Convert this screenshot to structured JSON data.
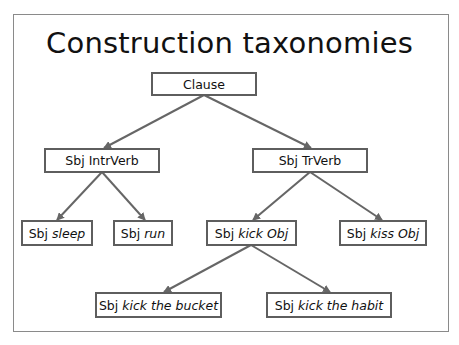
{
  "title": "Construction taxonomies",
  "colors": {
    "edge": "#666666",
    "node_border": "#5e5e5e",
    "text": "#111111",
    "frame": "#8a8a8a"
  },
  "nodes": {
    "clause": {
      "plain": "Clause",
      "italic": "",
      "tail": ""
    },
    "intrverb": {
      "plain": "Sbj IntrVerb",
      "italic": "",
      "tail": ""
    },
    "trverb": {
      "plain": "Sbj TrVerb",
      "italic": "",
      "tail": ""
    },
    "sleep": {
      "plain": "Sbj ",
      "italic": "sleep",
      "tail": ""
    },
    "run": {
      "plain": "Sbj ",
      "italic": "run",
      "tail": ""
    },
    "kick": {
      "plain": "Sbj ",
      "italic": "kick Obj",
      "tail": ""
    },
    "kiss": {
      "plain": "Sbj ",
      "italic": "kiss Obj",
      "tail": ""
    },
    "bucket": {
      "plain": "Sbj ",
      "italic": "kick the bucket",
      "tail": ""
    },
    "habit": {
      "plain": "Sbj ",
      "italic": "kick the habit",
      "tail": ""
    }
  },
  "edges": [
    [
      "clause",
      "intrverb"
    ],
    [
      "clause",
      "trverb"
    ],
    [
      "intrverb",
      "sleep"
    ],
    [
      "intrverb",
      "run"
    ],
    [
      "trverb",
      "kick"
    ],
    [
      "trverb",
      "kiss"
    ],
    [
      "kick",
      "bucket"
    ],
    [
      "kick",
      "habit"
    ]
  ]
}
